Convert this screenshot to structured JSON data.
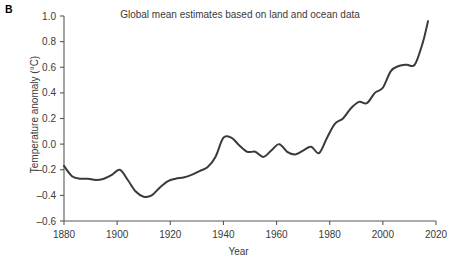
{
  "figure": {
    "panel_label": "B",
    "background_color": "#ffffff",
    "line_color": "#3a3a3a",
    "axis_color": "#58585a"
  },
  "chart_data": {
    "type": "line",
    "title": "Global mean estimates based on land and ocean data",
    "xlabel": "Year",
    "ylabel": "Temperature anomaly (°C)",
    "xlim": [
      1880,
      2020
    ],
    "ylim": [
      -0.6,
      1.0
    ],
    "xticks": [
      1880,
      1900,
      1920,
      1940,
      1960,
      1980,
      2000,
      2020
    ],
    "xtick_labels": [
      "1880",
      "1900",
      "1920",
      "1940",
      "1960",
      "1980",
      "2000",
      "2020"
    ],
    "yticks": [
      -0.6,
      -0.4,
      -0.2,
      0.0,
      0.2,
      0.4,
      0.6,
      0.8,
      1.0
    ],
    "ytick_labels": [
      "-0.6",
      "-0.4",
      "-0.2",
      "0.0",
      "0.2",
      "0.4",
      "0.6",
      "0.8",
      "1.0"
    ],
    "grid": false,
    "legend": "none",
    "series": [
      {
        "name": "Global mean temperature anomaly (smoothed)",
        "x": [
          1880,
          1883,
          1886,
          1889,
          1892,
          1895,
          1898,
          1901,
          1904,
          1907,
          1910,
          1913,
          1916,
          1919,
          1922,
          1925,
          1928,
          1931,
          1934,
          1937,
          1940,
          1943,
          1946,
          1949,
          1952,
          1955,
          1958,
          1961,
          1964,
          1967,
          1970,
          1973,
          1976,
          1979,
          1982,
          1985,
          1988,
          1991,
          1994,
          1997,
          2000,
          2003,
          2006,
          2009,
          2012,
          2015,
          2017
        ],
        "y": [
          -0.17,
          -0.25,
          -0.27,
          -0.27,
          -0.28,
          -0.27,
          -0.24,
          -0.2,
          -0.28,
          -0.37,
          -0.41,
          -0.4,
          -0.34,
          -0.29,
          -0.27,
          -0.26,
          -0.24,
          -0.21,
          -0.18,
          -0.1,
          0.05,
          0.05,
          -0.01,
          -0.06,
          -0.06,
          -0.1,
          -0.05,
          0.0,
          -0.06,
          -0.08,
          -0.05,
          -0.02,
          -0.07,
          0.05,
          0.16,
          0.2,
          0.28,
          0.33,
          0.32,
          0.4,
          0.44,
          0.57,
          0.61,
          0.62,
          0.62,
          0.79,
          0.96
        ]
      }
    ]
  }
}
